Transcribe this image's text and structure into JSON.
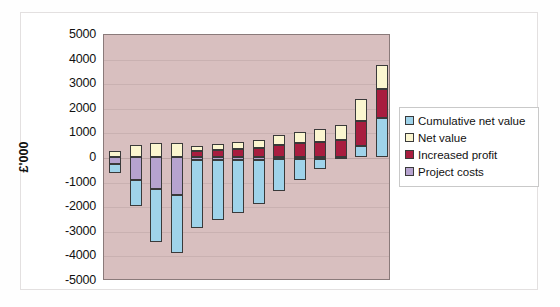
{
  "card": {
    "name": "chart-card"
  },
  "chart_data": {
    "type": "bar",
    "subtype": "stacked-column",
    "title": "",
    "xlabel": "",
    "ylabel": "£'000",
    "ylim": [
      -5000,
      5000
    ],
    "ytick_step": 1000,
    "ytick_labels": [
      "5000",
      "4000",
      "3000",
      "2000",
      "1000",
      "0",
      "-1000",
      "-2000",
      "-3000",
      "-4000",
      "-5000"
    ],
    "ytick_values": [
      5000,
      4000,
      3000,
      2000,
      1000,
      0,
      -1000,
      -2000,
      -3000,
      -4000,
      -5000
    ],
    "grid": true,
    "grid_axis": "y",
    "legend_position": "right",
    "plot_background": "#d8bfbf",
    "categories": [
      "1",
      "2",
      "3",
      "4",
      "5",
      "6",
      "7",
      "8",
      "9",
      "10",
      "11",
      "12",
      "13",
      "14"
    ],
    "series": [
      {
        "name": "Cumulative net value",
        "color": "#9fd3ea",
        "values": [
          -350,
          -1050,
          -2150,
          -2350,
          -2750,
          -2450,
          -2150,
          -1800,
          -1300,
          -850,
          -400,
          0,
          450,
          1600
        ]
      },
      {
        "name": "Net value",
        "color": "#fbf6d0",
        "values": [
          250,
          500,
          550,
          550,
          200,
          230,
          280,
          330,
          420,
          480,
          520,
          620,
          900,
          1000
        ]
      },
      {
        "name": "Increased profit",
        "color": "#a81d3f",
        "values": [
          0,
          0,
          0,
          0,
          250,
          300,
          330,
          350,
          480,
          550,
          620,
          700,
          1000,
          1150
        ]
      },
      {
        "name": "Project costs",
        "color": "#b6a3cf",
        "values": [
          -280,
          -950,
          -1300,
          -1550,
          -120,
          -120,
          -120,
          -120,
          -80,
          -80,
          -80,
          -80,
          0,
          0
        ]
      }
    ],
    "annotations": []
  },
  "legend": {
    "items": [
      {
        "label": "Cumulative net value",
        "color": "#9fd3ea",
        "name": "legend-cumulative-net-value"
      },
      {
        "label": "Net value",
        "color": "#fbf6d0",
        "name": "legend-net-value"
      },
      {
        "label": "Increased profit",
        "color": "#a81d3f",
        "name": "legend-increased-profit"
      },
      {
        "label": "Project costs",
        "color": "#b6a3cf",
        "name": "legend-project-costs"
      }
    ]
  }
}
